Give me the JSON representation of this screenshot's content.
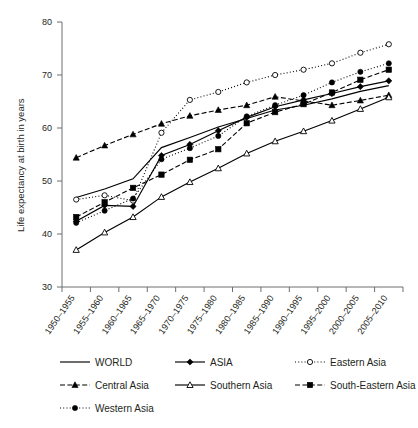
{
  "chart_data": {
    "type": "line",
    "title": "",
    "xlabel": "",
    "ylabel": "Life expectancy at birth in years",
    "ylim": [
      30,
      80
    ],
    "yticks": [
      30,
      40,
      50,
      60,
      70,
      80
    ],
    "grid": false,
    "legend_position": "bottom",
    "categories": [
      "1950–1955",
      "1955–1960",
      "1960–1965",
      "1965–1970",
      "1970–1975",
      "1975–1980",
      "1980–1985",
      "1985–1990",
      "1990–1995",
      "1995–2000",
      "2000–2005",
      "2005–2010"
    ],
    "series": [
      {
        "name": "WORLD",
        "marker": "none",
        "line": "solid",
        "values": [
          46.9,
          48.5,
          50.4,
          56.3,
          58.2,
          60.2,
          61.8,
          63.4,
          64.3,
          65.5,
          66.9,
          68.0
        ]
      },
      {
        "name": "ASIA",
        "marker": "filled-diamond",
        "line": "solid",
        "values": [
          42.4,
          45.4,
          45.2,
          54.8,
          56.9,
          59.5,
          62.0,
          64.0,
          65.3,
          66.5,
          67.8,
          68.9
        ]
      },
      {
        "name": "Eastern Asia",
        "marker": "open-circle",
        "line": "dotted",
        "values": [
          46.5,
          47.3,
          46.3,
          59.1,
          65.3,
          66.8,
          68.6,
          70.0,
          71.0,
          72.2,
          74.2,
          75.8
        ]
      },
      {
        "name": "Central Asia",
        "marker": "filled-triangle",
        "line": "dashed",
        "values": [
          54.4,
          56.7,
          58.8,
          60.8,
          62.3,
          63.4,
          64.3,
          65.9,
          65.1,
          64.3,
          65.2,
          66.2
        ]
      },
      {
        "name": "Southern Asia",
        "marker": "open-triangle",
        "line": "solid",
        "values": [
          37.0,
          40.3,
          43.2,
          47.0,
          49.8,
          52.4,
          55.2,
          57.5,
          59.4,
          61.4,
          63.6,
          65.8
        ]
      },
      {
        "name": "South-Eastern Asia",
        "marker": "filled-square",
        "line": "dashed",
        "values": [
          43.2,
          46.0,
          48.7,
          51.2,
          54.0,
          56.0,
          60.9,
          63.0,
          64.5,
          66.7,
          69.1,
          71.0
        ]
      },
      {
        "name": "Western Asia",
        "marker": "filled-circle",
        "line": "dotted",
        "values": [
          42.1,
          44.4,
          46.7,
          54.1,
          56.2,
          58.5,
          62.2,
          64.3,
          66.2,
          68.6,
          70.6,
          72.2
        ]
      }
    ]
  },
  "axis": {
    "y_title": "Life expectancy at birth in years",
    "y_tick_labels": [
      "30",
      "40",
      "50",
      "60",
      "70",
      "80"
    ],
    "x_tick_labels": [
      "1950–1955",
      "1955–1960",
      "1960–1965",
      "1965–1970",
      "1970–1975",
      "1975–1980",
      "1980–1985",
      "1985–1990",
      "1990–1995",
      "1995–2000",
      "2000–2005",
      "2005–2010"
    ]
  },
  "legend": {
    "entries": [
      {
        "label": "WORLD",
        "marker": "none",
        "line": "solid"
      },
      {
        "label": "ASIA",
        "marker": "filled-diamond",
        "line": "solid"
      },
      {
        "label": "Eastern Asia",
        "marker": "open-circle",
        "line": "dotted"
      },
      {
        "label": "Central Asia",
        "marker": "filled-triangle",
        "line": "dashed"
      },
      {
        "label": "Southern Asia",
        "marker": "open-triangle",
        "line": "solid"
      },
      {
        "label": "South-Eastern Asia",
        "marker": "filled-square",
        "line": "dashed"
      },
      {
        "label": "Western Asia",
        "marker": "filled-circle",
        "line": "dotted"
      }
    ]
  },
  "colors": {
    "series": "#000000",
    "axis": "#6d6e71",
    "text": "#231f20",
    "background": "#ffffff"
  }
}
